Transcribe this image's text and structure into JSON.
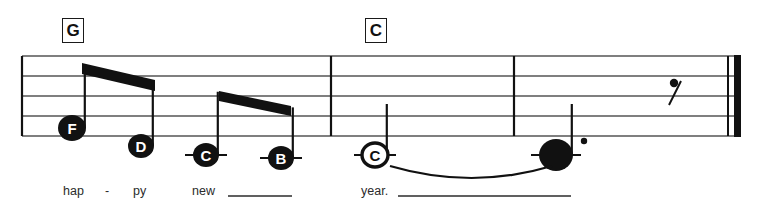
{
  "score": {
    "width": 780,
    "height": 213,
    "staff": {
      "left": 22,
      "right": 740,
      "top_line_y": 56,
      "line_spacing": 20,
      "line_count": 5,
      "line_color": "#555555",
      "ink_color": "#111111"
    },
    "chords": [
      {
        "label": "G",
        "x": 62,
        "y": 18
      },
      {
        "label": "C",
        "x": 365,
        "y": 18
      }
    ],
    "barlines": [
      {
        "name": "barline-1",
        "x": 331
      },
      {
        "name": "barline-2",
        "x": 514
      }
    ],
    "final_barline": {
      "thin_x": 728,
      "thick_x": 734,
      "thick_width": 7
    },
    "notes": [
      {
        "id": "note-f",
        "letter": "F",
        "x": 72,
        "y": 128,
        "rx": 14,
        "ry": 13,
        "filled": true,
        "stem": "up",
        "ledger": false,
        "dot": false
      },
      {
        "id": "note-d",
        "letter": "D",
        "x": 141,
        "y": 146,
        "rx": 13,
        "ry": 12,
        "filled": true,
        "stem": "up",
        "ledger": false,
        "dot": false
      },
      {
        "id": "note-c-low-1",
        "letter": "C",
        "x": 206,
        "y": 155,
        "rx": 13,
        "ry": 12,
        "filled": true,
        "stem": "up",
        "ledger": true,
        "dot": false
      },
      {
        "id": "note-b",
        "letter": "B",
        "x": 281,
        "y": 158,
        "rx": 13,
        "ry": 12,
        "filled": true,
        "stem": "up",
        "ledger": true,
        "dot": false
      },
      {
        "id": "note-c-hollow",
        "letter": "C",
        "x": 375,
        "y": 155,
        "rx": 13,
        "ry": 12,
        "filled": false,
        "stem": "up",
        "ledger": true,
        "dot": false
      },
      {
        "id": "note-final-dotted",
        "letter": "",
        "x": 556,
        "y": 155,
        "rx": 17,
        "ry": 16,
        "filled": true,
        "stem": "up",
        "ledger": true,
        "dot": true
      }
    ],
    "beams": [
      {
        "name": "beam-1",
        "x1": 82,
        "y1": 63,
        "x2": 155,
        "y2": 80,
        "thickness": 11
      },
      {
        "name": "beam-2",
        "x1": 219,
        "y1": 91,
        "x2": 291,
        "y2": 106,
        "thickness": 10
      }
    ],
    "slur": {
      "x1": 390,
      "y1": 166,
      "cx": 472,
      "cy": 190,
      "x2": 552,
      "y2": 166
    },
    "rest": {
      "name": "eighth-rest",
      "x": 672,
      "y": 82,
      "label": "eighth-rest"
    },
    "lyrics": [
      {
        "text": "hap",
        "x": 63,
        "y": 185,
        "extender": null
      },
      {
        "text": "-",
        "x": 105,
        "y": 185,
        "extender": null
      },
      {
        "text": "py",
        "x": 133,
        "y": 185,
        "extender": null
      },
      {
        "text": "new",
        "x": 192,
        "y": 185,
        "extender": {
          "x1": 228,
          "x2": 292,
          "y": 196
        }
      },
      {
        "text": "year.",
        "x": 361,
        "y": 185,
        "extender": {
          "x1": 398,
          "x2": 571,
          "y": 196
        }
      }
    ]
  }
}
